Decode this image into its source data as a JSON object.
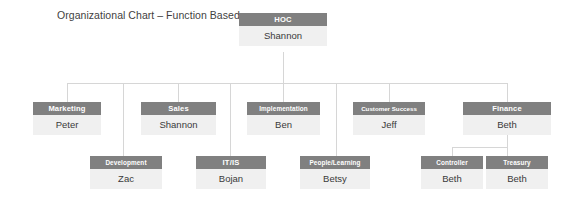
{
  "title": "Organizational Chart – Function Based",
  "colors": {
    "header_fill": "#808080",
    "body_fill": "#f0f0f0",
    "header_text": "#ffffff",
    "body_text": "#3a3a3a",
    "connector": "#d6d6d6",
    "title_text": "#3f3f3f",
    "background": "#ffffff"
  },
  "org": {
    "root": {
      "role": "HOC",
      "name": "Shannon"
    },
    "level2": [
      {
        "role": "Marketing",
        "name": "Peter"
      },
      {
        "role": "Sales",
        "name": "Shannon"
      },
      {
        "role": "Implementation",
        "name": "Ben"
      },
      {
        "role": "Customer Success",
        "name": "Jeff"
      },
      {
        "role": "Finance",
        "name": "Beth"
      }
    ],
    "level3": [
      {
        "role": "Development",
        "name": "Zac"
      },
      {
        "role": "IT/IS",
        "name": "Bojan"
      },
      {
        "role": "People/Learning",
        "name": "Betsy"
      },
      {
        "role": "Controller",
        "name": "Beth"
      },
      {
        "role": "Treasury",
        "name": "Beth"
      }
    ]
  }
}
